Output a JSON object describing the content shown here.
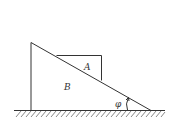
{
  "diagram": {
    "labels": {
      "block_a": "A",
      "block_b": "B",
      "angle": "φ"
    },
    "colors": {
      "stroke": "#333333",
      "background": "#ffffff"
    }
  }
}
